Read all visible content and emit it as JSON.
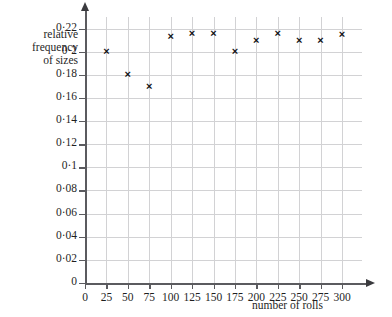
{
  "chart_data": {
    "type": "scatter",
    "title": "",
    "xlabel": "number of rolls",
    "ylabel": "relative frequency of sizes",
    "ylabel_lines": [
      "relative",
      "frequency",
      "of sizes"
    ],
    "x": [
      25,
      50,
      75,
      100,
      125,
      150,
      175,
      200,
      225,
      250,
      275,
      300
    ],
    "values": [
      0.2,
      0.18,
      0.17,
      0.213,
      0.216,
      0.216,
      0.2,
      0.21,
      0.216,
      0.21,
      0.21,
      0.215
    ],
    "xlim": [
      0,
      300
    ],
    "ylim": [
      0,
      0.23
    ],
    "xtick_labels": [
      "0",
      "25",
      "50",
      "75",
      "100",
      "125",
      "150",
      "175",
      "200",
      "225",
      "250",
      "275",
      "300"
    ],
    "xtick_values": [
      0,
      25,
      50,
      75,
      100,
      125,
      150,
      175,
      200,
      225,
      250,
      275,
      300
    ],
    "ytick_labels": [
      "0",
      "0·02",
      "0·04",
      "0·06",
      "0·08",
      "0·1",
      "0·12",
      "0·14",
      "0·16",
      "0·18",
      "0·2",
      "0·22"
    ],
    "ytick_values": [
      0,
      0.02,
      0.04,
      0.06,
      0.08,
      0.1,
      0.12,
      0.14,
      0.16,
      0.18,
      0.2,
      0.22
    ],
    "grid": true,
    "legend": false,
    "marker": "×",
    "marker_color": "#111114",
    "grid_color": "#d2d2d4",
    "axis_color": "#5b5b5f"
  }
}
